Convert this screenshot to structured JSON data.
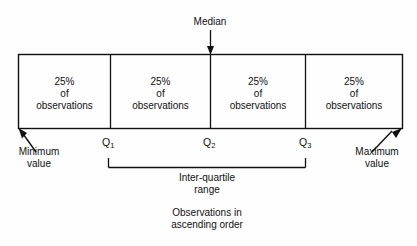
{
  "diagram": {
    "median_label": "Median",
    "minimum_label": "Minimum\nvalue",
    "minimum_label_line1": "Minimum",
    "minimum_label_line2": "value",
    "maximum_label_line1": "Maximum",
    "maximum_label_line2": "value",
    "iqr_label_line1": "Inter-quartile",
    "iqr_label_line2": "range",
    "caption_line1": "Observations in",
    "caption_line2": "ascending order",
    "line_color": "#101010",
    "background_color": "#fefefe",
    "cells": [
      {
        "percent": "25%",
        "of": "of",
        "unit": "observations"
      },
      {
        "percent": "25%",
        "of": "of",
        "unit": "observations"
      },
      {
        "percent": "25%",
        "of": "of",
        "unit": "observations"
      },
      {
        "percent": "25%",
        "of": "of",
        "unit": "observations"
      }
    ],
    "quartiles": [
      {
        "symbol": "Q",
        "subscript": "1"
      },
      {
        "symbol": "Q",
        "subscript": "2"
      },
      {
        "symbol": "Q",
        "subscript": "3"
      }
    ]
  }
}
